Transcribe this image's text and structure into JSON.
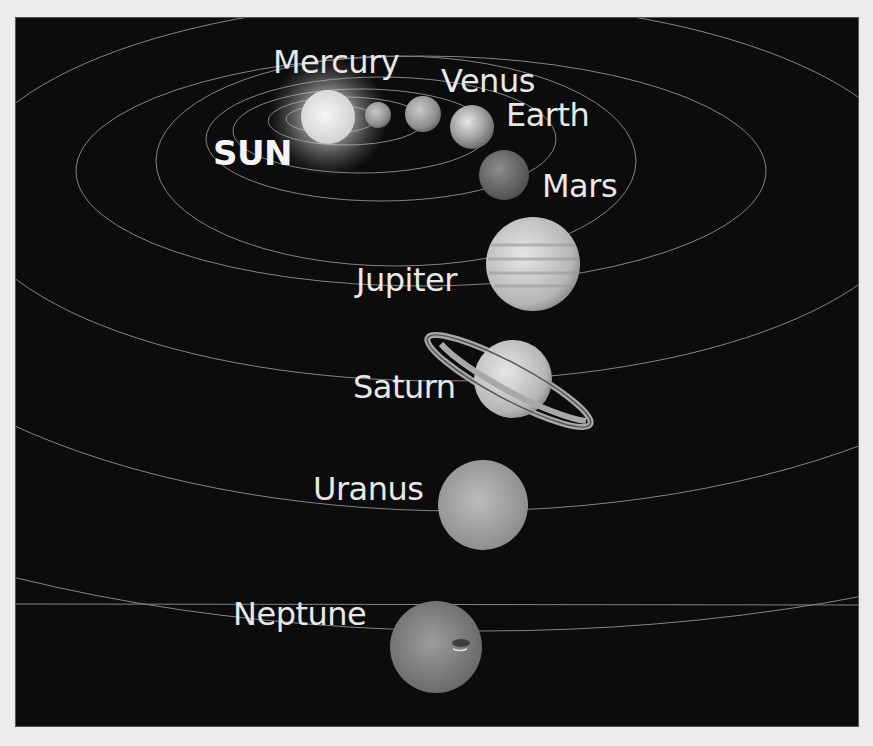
{
  "diagram": {
    "background_color": "#0c0c0c",
    "page_color": "#ececec",
    "label_color": "#e8e8e8",
    "bodies": [
      {
        "name": "SUN",
        "kind": "star",
        "cx": 327,
        "cy": 116,
        "r": 27,
        "label_x": 212,
        "label_y": 138,
        "font_size": 34
      },
      {
        "name": "Mercury",
        "kind": "planet",
        "cx": 377,
        "cy": 114,
        "r": 13,
        "label_x": 272,
        "label_y": 44,
        "font_size": 32
      },
      {
        "name": "Venus",
        "kind": "planet",
        "cx": 422,
        "cy": 113,
        "r": 18,
        "label_x": 440,
        "label_y": 64,
        "font_size": 32
      },
      {
        "name": "Earth",
        "kind": "planet",
        "cx": 471,
        "cy": 126,
        "r": 22,
        "label_x": 505,
        "label_y": 98,
        "font_size": 32
      },
      {
        "name": "Mars",
        "kind": "planet",
        "cx": 503,
        "cy": 174,
        "r": 25,
        "label_x": 541,
        "label_y": 170,
        "font_size": 32
      },
      {
        "name": "Jupiter",
        "kind": "planet",
        "cx": 532,
        "cy": 263,
        "r": 47,
        "label_x": 355,
        "label_y": 264,
        "font_size": 32
      },
      {
        "name": "Saturn",
        "kind": "planet",
        "cx": 512,
        "cy": 378,
        "r": 39,
        "label_x": 352,
        "label_y": 370,
        "font_size": 32
      },
      {
        "name": "Uranus",
        "kind": "planet",
        "cx": 482,
        "cy": 504,
        "r": 45,
        "label_x": 312,
        "label_y": 472,
        "font_size": 32
      },
      {
        "name": "Neptune",
        "kind": "planet",
        "cx": 435,
        "cy": 646,
        "r": 46,
        "label_x": 232,
        "label_y": 596,
        "font_size": 32
      }
    ]
  }
}
